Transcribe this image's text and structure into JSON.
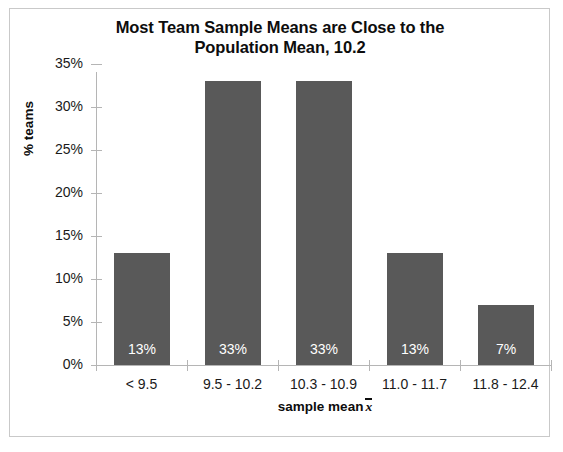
{
  "chart_data": {
    "type": "bar",
    "title": "Most Team Sample Means are Close to the Population Mean, 10.2",
    "title_line1": "Most Team Sample Means are Close to the",
    "title_line2": "Population Mean, 10.2",
    "xlabel": "sample mean",
    "xlabel_symbol": "x̄",
    "ylabel": "% teams",
    "categories": [
      "< 9.5",
      "9.5 - 10.2",
      "10.3 - 10.9",
      "11.0 - 11.7",
      "11.8 - 12.4"
    ],
    "values": [
      13,
      33,
      33,
      13,
      7
    ],
    "data_labels": [
      "13%",
      "33%",
      "33%",
      "13%",
      "7%"
    ],
    "ylim": [
      0,
      35
    ],
    "ytick_values": [
      0,
      5,
      10,
      15,
      20,
      25,
      30,
      35
    ],
    "ytick_labels": [
      "0%",
      "5%",
      "10%",
      "15%",
      "20%",
      "25%",
      "30%",
      "35%"
    ],
    "grid": false,
    "legend": "none",
    "bar_color": "#595959",
    "axis_color": "#b5b5b5",
    "text_color": "#1a1a1a",
    "label_color": "#ffffff",
    "frame_color": "#c9c9c9",
    "background": "#ffffff"
  }
}
